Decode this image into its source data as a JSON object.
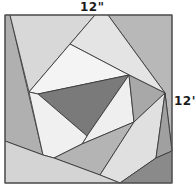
{
  "diagram": {
    "type": "quilt-block",
    "labels": {
      "width": "12\"",
      "height": "12\""
    },
    "frame": {
      "x": 5,
      "y": 15,
      "width": 167,
      "height": 168,
      "stroke": "#555555"
    },
    "pieces": [
      {
        "name": "left-strip",
        "points": "5,15 10,15 43,155 5,141",
        "fill": "#b0b0b0"
      },
      {
        "name": "top-left-light",
        "points": "10,15 95,15 70,44 29,92",
        "fill": "#d8d8d8"
      },
      {
        "name": "top-right-gray",
        "points": "108,15 172,15 172,151 165,93",
        "fill": "#b8b8b8"
      },
      {
        "name": "top-center-light",
        "points": "95,15 108,15 165,93 129,75 70,44",
        "fill": "#e4e4e4"
      },
      {
        "name": "upper-white",
        "points": "70,44 129,75 38,94 29,92",
        "fill": "#f4f4f4"
      },
      {
        "name": "center-dark-triangle",
        "points": "38,94 129,75 87,136",
        "fill": "#7a7a7a"
      },
      {
        "name": "center-right-white",
        "points": "129,75 134,122 82,144 87,136",
        "fill": "#efefef"
      },
      {
        "name": "right-gray-triangle",
        "points": "129,75 165,93 134,122",
        "fill": "#a8a8a8"
      },
      {
        "name": "left-center-white",
        "points": "29,92 38,94 87,136 82,144 54,158 43,155",
        "fill": "#f0f0f0"
      },
      {
        "name": "middle-band",
        "points": "54,158 82,144 134,122 100,175",
        "fill": "#b4b4b4"
      },
      {
        "name": "lower-right-light",
        "points": "134,122 165,93 156,158 120,183 100,175",
        "fill": "#e0e0e0"
      },
      {
        "name": "right-narrow-strip",
        "points": "165,93 172,151 156,158",
        "fill": "#a0a0a0"
      },
      {
        "name": "bottom-right-dark",
        "points": "120,183 156,158 172,151 172,183",
        "fill": "#8a8a8a"
      },
      {
        "name": "bottom-left-light",
        "points": "5,141 43,155 54,158 100,175 120,183 5,183",
        "fill": "#d4d4d4"
      }
    ]
  }
}
